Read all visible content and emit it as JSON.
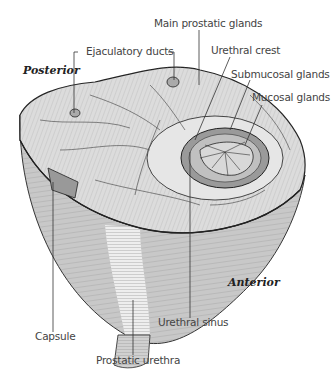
{
  "figure": {
    "orientation": {
      "posterior": "Posterior",
      "anterior": "Anterior"
    },
    "labels": {
      "main_prostatic_glands": "Main prostatic glands",
      "ejaculatory_ducts": "Ejaculatory ducts",
      "urethral_crest": "Urethral crest",
      "submucosal_glands": "Submucosal glands",
      "mucosal_glands": "Mucosal glands",
      "capsule": "Capsule",
      "urethral_sinus": "Urethral sinus",
      "prostatic_urethra": "Prostatic urethra"
    },
    "colors": {
      "ink": "#2a2a2a",
      "surface_top": "#d9d9d9",
      "surface_side": "#c4c4c4",
      "urethra_light": "#ececec",
      "background": "#ffffff"
    }
  }
}
